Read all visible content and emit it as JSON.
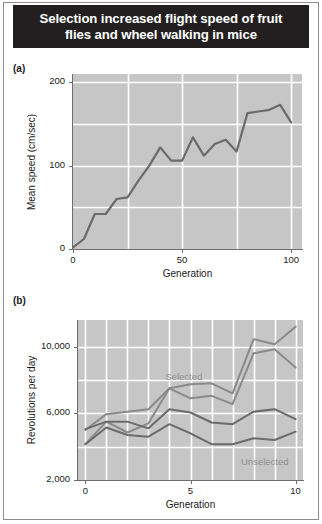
{
  "figure": {
    "title": "Selection increased flight speed of fruit flies and wheel walking in mice",
    "title_line1": "Selection increased flight speed of fruit",
    "title_line2": "flies and wheel walking in mice",
    "title_bg_color": "#231f20",
    "title_text_color": "#ffffff",
    "panel_a_label": "(a)",
    "panel_b_label": "(b)"
  },
  "chart_data": [
    {
      "id": "panel-a",
      "type": "line",
      "title": "",
      "panel_label": "(a)",
      "xlabel": "Generation",
      "ylabel": "Mean speed (cm/sec)",
      "xlim": [
        0,
        105
      ],
      "ylim": [
        0,
        210
      ],
      "xticks": [
        0,
        50,
        100
      ],
      "xtick_labels": [
        "0",
        "50",
        "100"
      ],
      "yticks": [
        0,
        100,
        200
      ],
      "ytick_labels": [
        "0",
        "100",
        "200"
      ],
      "gridlines_x": [
        25,
        50,
        75,
        100
      ],
      "gridlines_y": [
        50,
        100,
        150,
        200
      ],
      "grid": true,
      "grid_color": "#ffffff",
      "plot_bg_color": "#c6c6c6",
      "legend": "none",
      "series": [
        {
          "name": "Mean flight speed",
          "color": "#6b6b6b",
          "x": [
            0,
            5,
            10,
            15,
            20,
            25,
            30,
            35,
            40,
            45,
            50,
            55,
            60,
            65,
            70,
            75,
            80,
            85,
            90,
            95,
            100
          ],
          "values": [
            2,
            12,
            42,
            42,
            60,
            62,
            82,
            100,
            122,
            106,
            106,
            134,
            112,
            126,
            131,
            117,
            163,
            165,
            167,
            173,
            152
          ]
        }
      ]
    },
    {
      "id": "panel-b",
      "type": "line",
      "title": "",
      "panel_label": "(b)",
      "xlabel": "Generation",
      "ylabel": "Revolutions per day",
      "xlim": [
        -0.35,
        10.35
      ],
      "ylim": [
        2000,
        11600
      ],
      "xticks": [
        0,
        5,
        10
      ],
      "xtick_labels": [
        "0",
        "5",
        "10"
      ],
      "yticks": [
        2000,
        6000,
        10000
      ],
      "ytick_labels": [
        "2,000",
        "6,000",
        "10,000"
      ],
      "gridlines_x": [
        0,
        1,
        2,
        3,
        4,
        5,
        6,
        7,
        8,
        9,
        10
      ],
      "gridlines_y": [
        4000,
        6000,
        8000,
        10000
      ],
      "grid": true,
      "grid_color": "#ffffff",
      "plot_bg_color": "#c6c6c6",
      "legend": "in-plot-annotation",
      "annotations": [
        {
          "text": "Selected",
          "x": 3.8,
          "y": 8200,
          "color": "#8f8f8f"
        },
        {
          "text": "Unselected",
          "x": 7.4,
          "y": 3100,
          "color": "#8f8f8f"
        }
      ],
      "series": [
        {
          "name": "Selected line 1",
          "group": "Selected",
          "color": "#8a8a8a",
          "x": [
            0,
            1,
            2,
            3,
            4,
            5,
            6,
            7,
            8,
            9,
            10
          ],
          "values": [
            5000,
            5950,
            6100,
            6250,
            7500,
            7750,
            7800,
            7200,
            10450,
            10150,
            11200
          ]
        },
        {
          "name": "Selected line 2",
          "group": "Selected",
          "color": "#8a8a8a",
          "x": [
            0,
            1,
            2,
            3,
            4,
            5,
            6,
            7,
            8,
            9,
            10
          ],
          "values": [
            4150,
            5500,
            4850,
            5400,
            7500,
            6900,
            7050,
            6550,
            9600,
            9850,
            8750
          ]
        },
        {
          "name": "Unselected line 1",
          "group": "Unselected",
          "color": "#6b6b6b",
          "x": [
            0,
            1,
            2,
            3,
            4,
            5,
            6,
            7,
            8,
            9,
            10
          ],
          "values": [
            5050,
            5500,
            5500,
            5100,
            6250,
            6050,
            5450,
            5350,
            6100,
            6250,
            5650
          ]
        },
        {
          "name": "Unselected line 2",
          "group": "Unselected",
          "color": "#6b6b6b",
          "x": [
            0,
            1,
            2,
            3,
            4,
            5,
            6,
            7,
            8,
            9,
            10
          ],
          "values": [
            4150,
            5150,
            4700,
            4600,
            5350,
            4800,
            4150,
            4150,
            4500,
            4400,
            4900
          ]
        }
      ]
    }
  ]
}
